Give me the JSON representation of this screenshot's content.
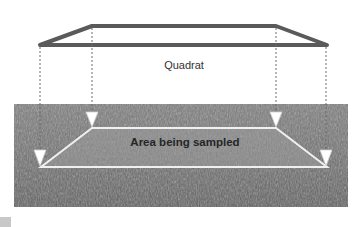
{
  "diagram": {
    "quadrat_label": "Quadrat",
    "area_label": "Area being sampled",
    "quadrat": {
      "top_edge": {
        "x1": 92,
        "x2": 276,
        "y": 26
      },
      "bottom_edge": {
        "x1": 40,
        "x2": 327,
        "y": 45
      },
      "stroke_color": "#5a5a5a"
    },
    "sampled_area": {
      "top_edge": {
        "x1": 92,
        "x2": 276,
        "y": 128
      },
      "bottom_edge": {
        "x1": 41,
        "x2": 327,
        "y": 167
      },
      "outline_color": "#f0f0f0",
      "fill_color": "#8e8e8e"
    },
    "projection_arrows": [
      {
        "x": 40,
        "y1": 46,
        "y2": 166
      },
      {
        "x": 92,
        "y1": 27,
        "y2": 127
      },
      {
        "x": 276,
        "y1": 27,
        "y2": 127
      },
      {
        "x": 326,
        "y1": 46,
        "y2": 166
      }
    ],
    "photo": {
      "description": "grassy field",
      "base_color": "#6e6e6e"
    }
  }
}
